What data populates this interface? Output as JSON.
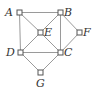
{
  "diagram": {
    "type": "graph",
    "nodes": [
      {
        "id": "A",
        "label": "A",
        "x": 19,
        "y": 12,
        "lx": 5,
        "ly": 16
      },
      {
        "id": "B",
        "label": "B",
        "x": 60,
        "y": 12,
        "lx": 64,
        "ly": 16
      },
      {
        "id": "E",
        "label": "E",
        "x": 40,
        "y": 32,
        "lx": 44,
        "ly": 36
      },
      {
        "id": "F",
        "label": "F",
        "x": 79,
        "y": 32,
        "lx": 83,
        "ly": 36
      },
      {
        "id": "D",
        "label": "D",
        "x": 20,
        "y": 52,
        "lx": 6,
        "ly": 56
      },
      {
        "id": "C",
        "label": "C",
        "x": 60,
        "y": 52,
        "lx": 64,
        "ly": 56
      },
      {
        "id": "G",
        "label": "G",
        "x": 40,
        "y": 72,
        "lx": 36,
        "ly": 87
      }
    ],
    "edges": [
      [
        "A",
        "B"
      ],
      [
        "A",
        "D"
      ],
      [
        "A",
        "E"
      ],
      [
        "E",
        "C"
      ],
      [
        "B",
        "E"
      ],
      [
        "E",
        "D"
      ],
      [
        "B",
        "C"
      ],
      [
        "B",
        "F"
      ],
      [
        "F",
        "C"
      ],
      [
        "D",
        "C"
      ],
      [
        "D",
        "G"
      ],
      [
        "C",
        "G"
      ]
    ]
  },
  "labels": {
    "A": "A",
    "B": "B",
    "C": "C",
    "D": "D",
    "E": "E",
    "F": "F",
    "G": "G"
  }
}
